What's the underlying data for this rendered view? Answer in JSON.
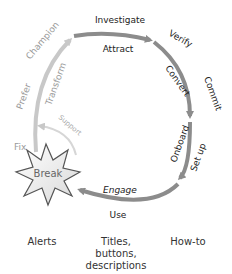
{
  "diagram": {
    "outer_labels": {
      "investigate": "Investigate",
      "verify": "Verify",
      "commit": "Commit",
      "set_up": "Set up",
      "use": "Use",
      "fix": "Fix",
      "prefer": "Prefer",
      "champion": "Champion"
    },
    "inner_labels": {
      "attract": "Attract",
      "convert": "Convert",
      "onboard": "Onboard",
      "engage": "Engage",
      "transform": "Transform",
      "support": "Support"
    },
    "center_node": "Break",
    "colors": {
      "main_arc": "#8c8c8c",
      "light_arc": "#c8c8c8",
      "text_dark": "#222222",
      "text_light": "#9a9a9a"
    }
  },
  "bottom_labels": {
    "alerts": "Alerts",
    "titles": "Titles, buttons,",
    "titles_line2": "descriptions",
    "howto": "How-to"
  }
}
